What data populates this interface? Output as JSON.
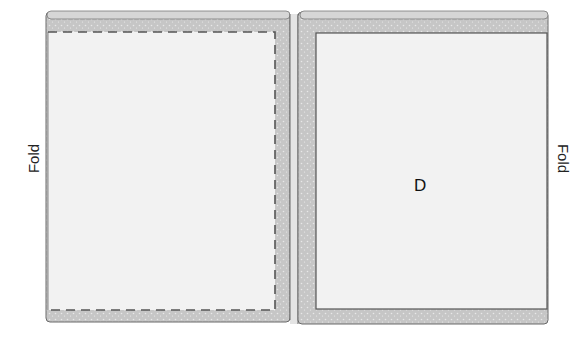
{
  "diagram": {
    "labels": {
      "fold_left": "Fold",
      "fold_right": "Fold",
      "piece_letter": "D"
    },
    "colors": {
      "fabric_border": "#c9c9c9",
      "fabric_inner": "#f1f1f1",
      "outline": "#6a6a6a",
      "stitch": "#555555",
      "background": "#ffffff"
    },
    "panels": [
      {
        "name": "left-panel",
        "stitching": "dashed"
      },
      {
        "name": "right-panel",
        "stitching": "solid",
        "letter": "D"
      }
    ]
  }
}
